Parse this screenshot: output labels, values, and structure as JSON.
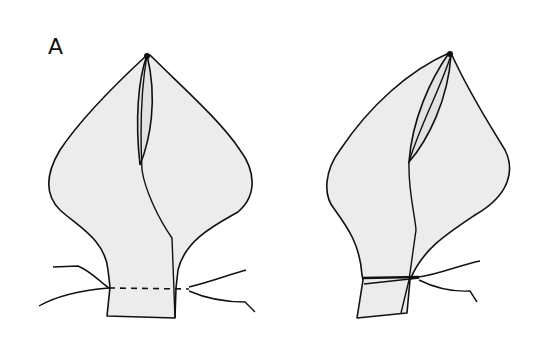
{
  "figure": {
    "panel_label": "A",
    "left_drawing": {
      "description": "Pointed bag shape with overlapping fold, neck with dashed tie line and loose string ends",
      "tie_style": "dashed"
    },
    "right_drawing": {
      "description": "Same bag shape tilted, neck tied tightly with string, loose ends to the right",
      "tie_style": "solid"
    },
    "colors": {
      "fill": "#ececec",
      "stroke": "#111111",
      "background": "#ffffff"
    }
  }
}
